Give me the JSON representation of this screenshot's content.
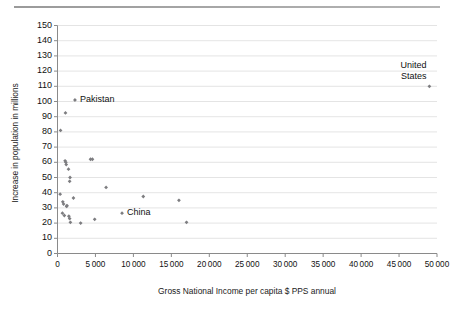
{
  "chart_data": {
    "type": "scatter",
    "title": "",
    "xlabel": "Gross National Income per capita $ PPS annual",
    "ylabel": "Increase in population in millions",
    "xlim": [
      0,
      50000
    ],
    "ylim": [
      0,
      150
    ],
    "grid": "horizontal",
    "legend": "none",
    "marker": "small grey diamond",
    "marker_color": "#7d7d80",
    "xticks": [
      "0",
      "5000",
      "10000",
      "15000",
      "20000",
      "25000",
      "30000",
      "35000",
      "40000",
      "45000",
      "50000"
    ],
    "yticks": [
      "0",
      "10",
      "20",
      "30",
      "40",
      "50",
      "60",
      "70",
      "80",
      "90",
      "100",
      "110",
      "120",
      "130",
      "140",
      "150"
    ],
    "points": [
      {
        "x": 400,
        "y": 81
      },
      {
        "x": 1050,
        "y": 92.5
      },
      {
        "x": 2300,
        "y": 101
      },
      {
        "x": 1000,
        "y": 61
      },
      {
        "x": 1100,
        "y": 60
      },
      {
        "x": 1150,
        "y": 58.5
      },
      {
        "x": 4350,
        "y": 62
      },
      {
        "x": 4600,
        "y": 62
      },
      {
        "x": 1450,
        "y": 55.5
      },
      {
        "x": 1600,
        "y": 47.5
      },
      {
        "x": 1650,
        "y": 50
      },
      {
        "x": 6400,
        "y": 43.5
      },
      {
        "x": 350,
        "y": 39
      },
      {
        "x": 2100,
        "y": 36.5
      },
      {
        "x": 11300,
        "y": 37.5
      },
      {
        "x": 16000,
        "y": 35
      },
      {
        "x": 700,
        "y": 34
      },
      {
        "x": 800,
        "y": 32.5
      },
      {
        "x": 1200,
        "y": 31
      },
      {
        "x": 1250,
        "y": 31.5
      },
      {
        "x": 8500,
        "y": 26.5
      },
      {
        "x": 650,
        "y": 26.5
      },
      {
        "x": 900,
        "y": 25
      },
      {
        "x": 1500,
        "y": 24.5
      },
      {
        "x": 1600,
        "y": 23
      },
      {
        "x": 4900,
        "y": 22.5
      },
      {
        "x": 3050,
        "y": 20
      },
      {
        "x": 1700,
        "y": 20.5
      },
      {
        "x": 17000,
        "y": 20.5
      },
      {
        "x": 49000,
        "y": 110
      }
    ],
    "annotations": [
      {
        "label": "Pakistan",
        "x": 2300,
        "y": 101,
        "placement": "right"
      },
      {
        "label": "China",
        "x": 8500,
        "y": 26.5,
        "placement": "right"
      },
      {
        "label": "United States",
        "lines": [
          "United",
          "States"
        ],
        "x": 49000,
        "y": 110,
        "placement": "upper-left"
      }
    ]
  },
  "figure": {
    "axis_color": "#8a8a8a",
    "grid_color": "#dddddd",
    "top_rule_color": "#9a9a9a"
  }
}
